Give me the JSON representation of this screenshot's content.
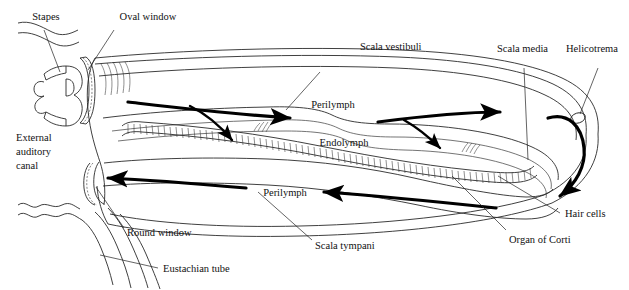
{
  "figure": {
    "type": "anatomical-diagram",
    "background_color": "#ffffff",
    "line_color": "#2a2a2a",
    "arrow_color": "#000000"
  },
  "labels": {
    "stapes": "Stapes",
    "oval_window": "Oval window",
    "scala_vestibuli": "Scala vestibuli",
    "scala_media": "Scala media",
    "helicotrema": "Helicotrema",
    "external_auditory_canal_line1": "External",
    "external_auditory_canal_line2": "auditory",
    "external_auditory_canal_line3": "canal",
    "perilymph_upper": "Perilymph",
    "perilymph_lower": "Perilymph",
    "endolymph": "Endolymph",
    "hair_cells": "Hair cells",
    "organ_of_corti": "Organ of Corti",
    "round_window": "Round window",
    "scala_tympani": "Scala tympani",
    "eustachian_tube": "Eustachian tube"
  },
  "structures": [
    {
      "name": "stapes",
      "description": "stirrup-shaped middle ear ossicle at left"
    },
    {
      "name": "oval-window",
      "description": "membrane struck by stapes footplate"
    },
    {
      "name": "round-window",
      "description": "lower membrane at left end of scala tympani"
    },
    {
      "name": "scala-vestibuli",
      "description": "upper perilymph-filled channel"
    },
    {
      "name": "scala-media",
      "description": "central endolymph-filled cochlear duct"
    },
    {
      "name": "scala-tympani",
      "description": "lower perilymph-filled channel"
    },
    {
      "name": "basilar-membrane",
      "description": "hatched band bearing the organ of Corti"
    },
    {
      "name": "helicotrema",
      "description": "apical opening joining the two perilymph scalae"
    },
    {
      "name": "eustachian-tube",
      "description": "tube descending from middle ear cavity"
    },
    {
      "name": "external-auditory-canal",
      "description": "outer ear canal at far left"
    }
  ],
  "flow": {
    "upper_direction": "left-to-right",
    "lower_direction": "right-to-left",
    "description": "Perilymph wave enters at the oval window, travels apically through the scala vestibuli, passes the helicotrema, returns through the scala tympani and dissipates at the round window"
  }
}
